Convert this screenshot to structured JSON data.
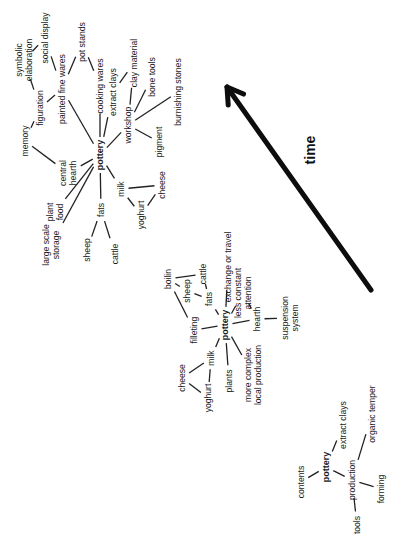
{
  "diagram": {
    "arrow": {
      "label": "time",
      "x1": 371,
      "y1": 290,
      "x2": 227,
      "y2": 87,
      "label_x": 315,
      "label_y": 150
    },
    "clusters": [
      {
        "name": "late",
        "nodes": [
          {
            "id": "pottery",
            "label": [
              "pottery"
            ],
            "x": 100,
            "y": 155,
            "bold": true
          },
          {
            "id": "symbolic",
            "label": [
              "symbolic",
              "elaboration"
            ],
            "x": 24,
            "y": 60
          },
          {
            "id": "social",
            "label": [
              "social display"
            ],
            "x": 45,
            "y": 38
          },
          {
            "id": "painted",
            "label": [
              "painted fine wares"
            ],
            "x": 62,
            "y": 89
          },
          {
            "id": "potstands",
            "label": [
              "pot stands"
            ],
            "x": 82,
            "y": 42
          },
          {
            "id": "cooking",
            "label": [
              "cooking wares"
            ],
            "x": 100,
            "y": 86
          },
          {
            "id": "figuration",
            "label": [
              "figuration"
            ],
            "x": 40,
            "y": 108
          },
          {
            "id": "memory",
            "label": [
              "memory"
            ],
            "x": 25,
            "y": 141
          },
          {
            "id": "extract",
            "label": [
              "extract clays"
            ],
            "x": 113,
            "y": 92
          },
          {
            "id": "claymat",
            "label": [
              "clay material"
            ],
            "x": 134,
            "y": 63
          },
          {
            "id": "bonetools",
            "label": [
              "bone tools"
            ],
            "x": 152,
            "y": 77
          },
          {
            "id": "workshop",
            "label": [
              "workshop"
            ],
            "x": 128,
            "y": 125
          },
          {
            "id": "burnishing",
            "label": [
              "burnishing stones"
            ],
            "x": 178,
            "y": 92
          },
          {
            "id": "pigment",
            "label": [
              "pigment"
            ],
            "x": 159,
            "y": 142
          },
          {
            "id": "central",
            "label": [
              "central",
              "hearth"
            ],
            "x": 68,
            "y": 173
          },
          {
            "id": "plantfood",
            "label": [
              "plant",
              "food"
            ],
            "x": 55,
            "y": 212
          },
          {
            "id": "milk",
            "label": [
              "milk"
            ],
            "x": 121,
            "y": 189
          },
          {
            "id": "cheese",
            "label": [
              "cheese"
            ],
            "x": 162,
            "y": 185
          },
          {
            "id": "yoghurt",
            "label": [
              "yoghurt"
            ],
            "x": 141,
            "y": 215
          },
          {
            "id": "fats",
            "label": [
              "fats"
            ],
            "x": 101,
            "y": 210
          },
          {
            "id": "storage",
            "label": [
              "large scale",
              "storage"
            ],
            "x": 51,
            "y": 245
          },
          {
            "id": "sheep",
            "label": [
              "sheep"
            ],
            "x": 87,
            "y": 250
          },
          {
            "id": "cattle",
            "label": [
              "cattle"
            ],
            "x": 115,
            "y": 254
          }
        ],
        "edges": [
          [
            "symbolic",
            "social"
          ],
          [
            "symbolic",
            "figuration"
          ],
          [
            "social",
            "painted"
          ],
          [
            "painted",
            "potstands"
          ],
          [
            "potstands",
            "cooking"
          ],
          [
            "painted",
            "figuration"
          ],
          [
            "painted",
            "pottery"
          ],
          [
            "figuration",
            "memory"
          ],
          [
            "memory",
            "central"
          ],
          [
            "cooking",
            "pottery"
          ],
          [
            "extract",
            "pottery"
          ],
          [
            "extract",
            "claymat"
          ],
          [
            "claymat",
            "workshop"
          ],
          [
            "bonetools",
            "workshop"
          ],
          [
            "burnishing",
            "workshop"
          ],
          [
            "pigment",
            "workshop"
          ],
          [
            "workshop",
            "pottery"
          ],
          [
            "central",
            "pottery"
          ],
          [
            "plantfood",
            "pottery"
          ],
          [
            "storage",
            "pottery"
          ],
          [
            "fats",
            "pottery"
          ],
          [
            "milk",
            "pottery"
          ],
          [
            "milk",
            "cheese"
          ],
          [
            "milk",
            "yoghurt"
          ],
          [
            "yoghurt",
            "cheese"
          ],
          [
            "fats",
            "sheep"
          ],
          [
            "fats",
            "cattle"
          ]
        ]
      },
      {
        "name": "middle",
        "nodes": [
          {
            "id": "pottery",
            "label": [
              "pottery"
            ],
            "x": 225,
            "y": 325,
            "bold": true
          },
          {
            "id": "boiling",
            "label": [
              "boilin"
            ],
            "x": 168,
            "y": 279
          },
          {
            "id": "sheep",
            "label": [
              "sheep"
            ],
            "x": 187,
            "y": 291
          },
          {
            "id": "cattle",
            "label": [
              "cattle"
            ],
            "x": 203,
            "y": 274
          },
          {
            "id": "fats",
            "label": [
              "fats"
            ],
            "x": 209,
            "y": 299
          },
          {
            "id": "exchange",
            "label": [
              "exchange or travel"
            ],
            "x": 228,
            "y": 267
          },
          {
            "id": "lessconst",
            "label": [
              "less constant",
              "attention"
            ],
            "x": 243,
            "y": 293
          },
          {
            "id": "filleting",
            "label": [
              "filleting"
            ],
            "x": 194,
            "y": 330
          },
          {
            "id": "hearth",
            "label": [
              "hearth"
            ],
            "x": 257,
            "y": 319
          },
          {
            "id": "suspension",
            "label": [
              "suspension",
              "system"
            ],
            "x": 290,
            "y": 318
          },
          {
            "id": "milk",
            "label": [
              "milk"
            ],
            "x": 211,
            "y": 358
          },
          {
            "id": "cheese",
            "label": [
              "cheese"
            ],
            "x": 182,
            "y": 378
          },
          {
            "id": "yoghurt",
            "label": [
              "yoghurt"
            ],
            "x": 208,
            "y": 398
          },
          {
            "id": "plants",
            "label": [
              "plants"
            ],
            "x": 229,
            "y": 381
          },
          {
            "id": "complex",
            "label": [
              "more complex",
              "local production"
            ],
            "x": 253,
            "y": 375
          }
        ],
        "edges": [
          [
            "boiling",
            "cattle"
          ],
          [
            "boiling",
            "sheep"
          ],
          [
            "sheep",
            "fats"
          ],
          [
            "cattle",
            "fats"
          ],
          [
            "boiling",
            "filleting"
          ],
          [
            "fats",
            "pottery"
          ],
          [
            "exchange",
            "pottery"
          ],
          [
            "lessconst",
            "pottery"
          ],
          [
            "lessconst",
            "hearth"
          ],
          [
            "hearth",
            "pottery"
          ],
          [
            "hearth",
            "suspension"
          ],
          [
            "filleting",
            "pottery"
          ],
          [
            "milk",
            "pottery"
          ],
          [
            "plants",
            "pottery"
          ],
          [
            "complex",
            "pottery"
          ],
          [
            "milk",
            "cheese"
          ],
          [
            "milk",
            "yoghurt"
          ],
          [
            "cheese",
            "yoghurt"
          ]
        ]
      },
      {
        "name": "early",
        "nodes": [
          {
            "id": "pottery",
            "label": [
              "pottery"
            ],
            "x": 326,
            "y": 467,
            "bold": true
          },
          {
            "id": "contents",
            "label": [
              "contents"
            ],
            "x": 301,
            "y": 482
          },
          {
            "id": "extract",
            "label": [
              "extract clays"
            ],
            "x": 343,
            "y": 425
          },
          {
            "id": "organic",
            "label": [
              "organic temper"
            ],
            "x": 372,
            "y": 414
          },
          {
            "id": "production",
            "label": [
              "production"
            ],
            "x": 352,
            "y": 480
          },
          {
            "id": "forming",
            "label": [
              "forming"
            ],
            "x": 381,
            "y": 489
          },
          {
            "id": "tools",
            "label": [
              "tools"
            ],
            "x": 357,
            "y": 525
          }
        ],
        "edges": [
          [
            "contents",
            "pottery"
          ],
          [
            "extract",
            "pottery"
          ],
          [
            "pottery",
            "production"
          ],
          [
            "production",
            "organic"
          ],
          [
            "production",
            "forming"
          ],
          [
            "production",
            "tools"
          ]
        ]
      }
    ]
  }
}
